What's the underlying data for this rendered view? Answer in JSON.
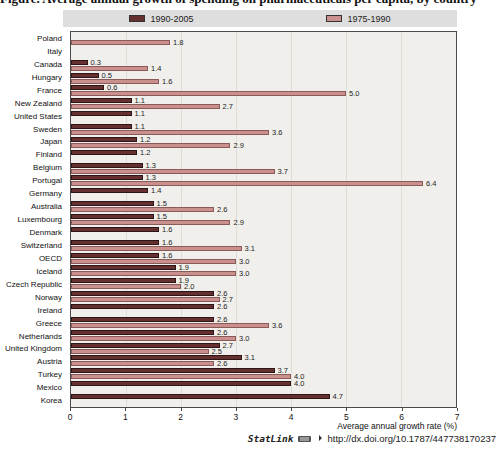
{
  "title_cropped_fragment": "Figure. Average annual growth of spending on pharmaceuticals per capita, by country",
  "legend": {
    "series1_label": "1990-2005",
    "series2_label": "1975-1990"
  },
  "axis": {
    "ticks": [
      "0",
      "1",
      "2",
      "3",
      "4",
      "5",
      "6",
      "7"
    ],
    "max": 7,
    "label": "Average annual growth rate (%)"
  },
  "footer": {
    "statlink_label": "StatLink",
    "statlink_url": "http://dx.doi.org/10.1787/447738170237"
  },
  "colors": {
    "series_1990_2005": "#663030",
    "series_1990_2005_border": "#2e1515",
    "series_1975_1990": "#c9908d",
    "series_1975_1990_border": "#8a5a58",
    "plot_background": "#f0efeb",
    "legend_background": "#dedede"
  },
  "chart_data": {
    "type": "bar",
    "orientation": "horizontal",
    "title": "",
    "xlabel": "Average annual growth rate (%)",
    "ylabel": "",
    "xlim": [
      0,
      7
    ],
    "grid": true,
    "legend_position": "top",
    "categories": [
      "Poland",
      "Italy",
      "Canada",
      "Hungary",
      "France",
      "New Zealand",
      "United States",
      "Sweden",
      "Japan",
      "Finland",
      "Belgium",
      "Portugal",
      "Germany",
      "Australia",
      "Luxembourg",
      "Denmark",
      "Switzerland",
      "OECD",
      "Iceland",
      "Czech Republic",
      "Norway",
      "Ireland",
      "Greece",
      "Netherlands",
      "United Kingdom",
      "Austria",
      "Turkey",
      "Mexico",
      "Korea"
    ],
    "series": [
      {
        "name": "1990-2005",
        "color": "#663030",
        "values": [
          null,
          null,
          0.3,
          0.5,
          0.6,
          1.1,
          1.1,
          1.1,
          1.2,
          1.2,
          1.3,
          1.3,
          1.4,
          1.5,
          1.5,
          1.6,
          1.6,
          1.6,
          1.9,
          1.9,
          2.6,
          2.6,
          2.6,
          2.6,
          2.7,
          3.1,
          3.7,
          4.0,
          4.7
        ]
      },
      {
        "name": "1975-1990",
        "color": "#c9908d",
        "values": [
          1.8,
          null,
          1.4,
          1.6,
          5.0,
          2.7,
          null,
          3.6,
          2.9,
          null,
          3.7,
          6.4,
          null,
          2.6,
          2.9,
          null,
          3.1,
          3.0,
          3.0,
          2.0,
          2.7,
          null,
          3.6,
          3.0,
          2.5,
          2.6,
          4.0,
          null,
          null
        ]
      }
    ]
  }
}
